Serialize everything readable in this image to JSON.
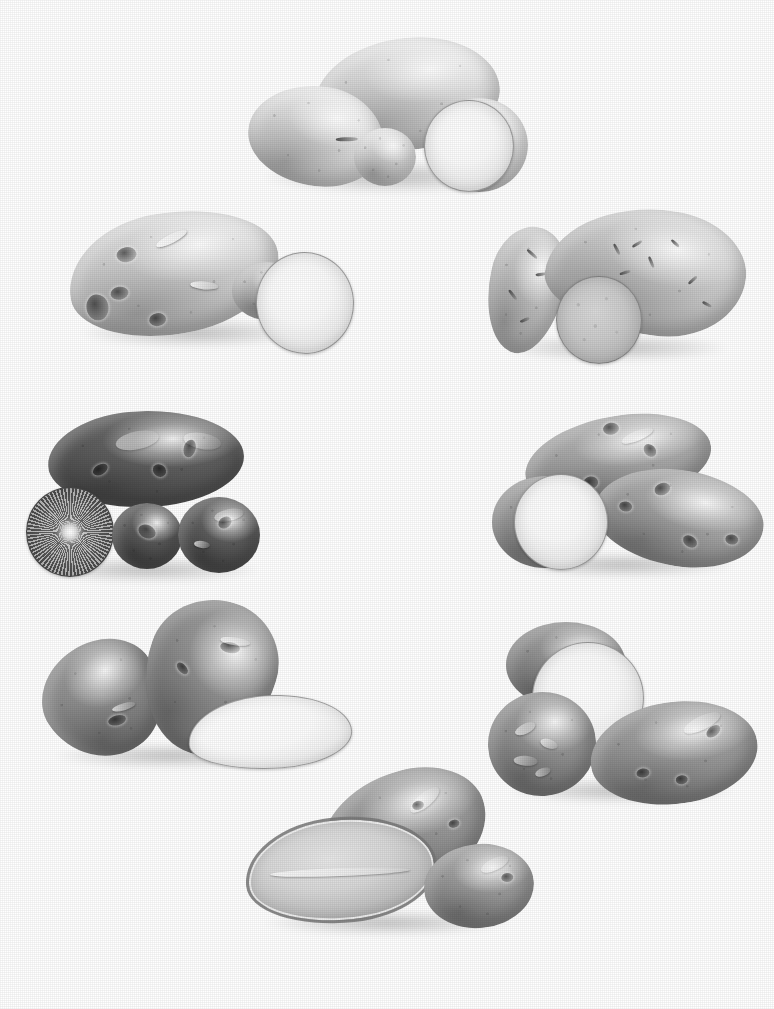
{
  "plate": {
    "title": "Potato variety comparison plate",
    "medium": "black-and-white photographic plate",
    "background_color": "#ffffff",
    "layout": "seven specimen groups arranged in a ring",
    "width": 774,
    "height": 1009,
    "caption": "",
    "has_text_labels": false
  },
  "palette": {
    "background": "#ffffff",
    "pale_skin": "#ededed",
    "light_skin": "#d6d6d6",
    "mid_skin": "#a8a8a8",
    "dark_skin": "#6e6e6e",
    "very_dark_skin": "#4a4a4a",
    "cut_flesh_white": "#fbfbfb",
    "cut_flesh_cream": "#dcdcdc",
    "outline": "#5a5a5a"
  },
  "groups": [
    {
      "id": "group-top",
      "name": "pale-white-round-tubers",
      "position": "top center",
      "specimen_count": 5,
      "skin_tone": "very pale white",
      "flesh_tone": "white",
      "shape": "round to short-oval",
      "has_cut_specimen": true,
      "notes": "five smooth pale tubers with one sliced showing a white cut face"
    },
    {
      "id": "group-upper-left",
      "name": "pale-knobby-tuber-with-slice",
      "position": "upper left",
      "specimen_count": 2,
      "skin_tone": "pale grey-white",
      "flesh_tone": "white",
      "shape": "elongated knobby with deep eyes",
      "has_cut_specimen": true,
      "notes": "one long deep-eyed tuber beside a large oval white cut face"
    },
    {
      "id": "group-upper-right",
      "name": "sweet-potato-group",
      "position": "upper right",
      "specimen_count": 3,
      "skin_tone": "light grey",
      "flesh_tone": "medium grey, speckled",
      "shape": "tapered spindle",
      "has_cut_specimen": true,
      "notes": "two tapered sweet potatoes with a round cross-section slice"
    },
    {
      "id": "group-middle-left",
      "name": "dark-purple-tubers",
      "position": "middle left",
      "specimen_count": 4,
      "skin_tone": "very dark, near black",
      "flesh_tone": "dark with radial light pattern",
      "shape": "broad oval and round",
      "has_cut_specimen": true,
      "notes": "one large dark oblong tuber above three rounds, one halved showing a radial starburst flesh pattern"
    },
    {
      "id": "group-middle-right",
      "name": "russet-oblong-tubers",
      "position": "middle right",
      "specimen_count": 3,
      "skin_tone": "medium grey with mottling",
      "flesh_tone": "white",
      "shape": "long oblong",
      "has_cut_specimen": true,
      "notes": "two long oblong tubers with a round white cut face in front"
    },
    {
      "id": "group-lower-left",
      "name": "dark-oval-tubers-with-white-slice",
      "position": "lower left",
      "specimen_count": 3,
      "skin_tone": "dark grey",
      "flesh_tone": "bright white",
      "shape": "long oval",
      "has_cut_specimen": true,
      "notes": "two dark ovals leaning together with a bright white lengthwise half below"
    },
    {
      "id": "group-lower-right",
      "name": "round-tubers-with-halved-specimen",
      "position": "lower right",
      "specimen_count": 3,
      "skin_tone": "medium to dark grey, flaky skin",
      "flesh_tone": "white",
      "shape": "round to oval",
      "has_cut_specimen": true,
      "notes": "a halved round tuber showing white flesh, a flaky-skinned round and a smooth oval"
    },
    {
      "id": "group-bottom",
      "name": "long-tubers-with-lengthwise-half",
      "position": "bottom center",
      "specimen_count": 3,
      "skin_tone": "medium grey",
      "flesh_tone": "pale grey",
      "shape": "long oblong and round",
      "has_cut_specimen": true,
      "notes": "a lengthwise half with visible rim, a long whole tuber and a round tuber"
    }
  ]
}
